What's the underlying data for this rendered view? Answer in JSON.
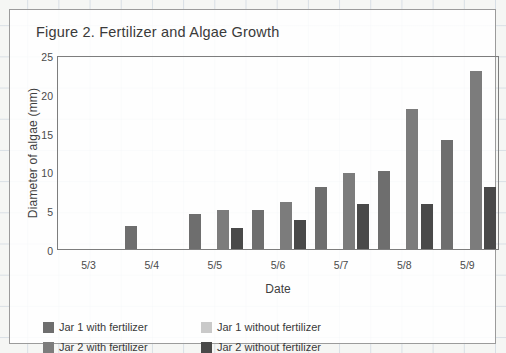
{
  "card": {
    "title": "Figure 2. Fertilizer and Algae Growth"
  },
  "chart_data": {
    "type": "bar",
    "title": "Figure 2. Fertilizer and Algae Growth",
    "xlabel": "Date",
    "ylabel": "Diameter of algae (mm)",
    "categories": [
      "5/3",
      "5/4",
      "5/5",
      "5/6",
      "5/7",
      "5/8",
      "5/9"
    ],
    "ylim": [
      0,
      25
    ],
    "yticks": [
      0,
      5,
      10,
      15,
      20,
      25
    ],
    "grid": false,
    "legend_position": "bottom",
    "series": [
      {
        "name": "Jar 1 with fertilizer",
        "color": "#6e6e6e",
        "values": [
          0,
          3,
          4.5,
          5,
          8,
          10,
          14
        ]
      },
      {
        "name": "Jar 1 without fertilizer",
        "color": "#c9c9c9",
        "values": [
          0,
          0,
          0,
          0,
          0,
          0,
          0
        ]
      },
      {
        "name": "Jar 2 with fertilizer",
        "color": "#7c7c7c",
        "values": [
          0,
          0,
          5,
          6,
          9.8,
          18,
          23
        ]
      },
      {
        "name": "Jar 2 without fertilizer",
        "color": "#494949",
        "values": [
          0,
          0,
          2.7,
          3.7,
          5.8,
          5.8,
          8
        ]
      }
    ]
  }
}
